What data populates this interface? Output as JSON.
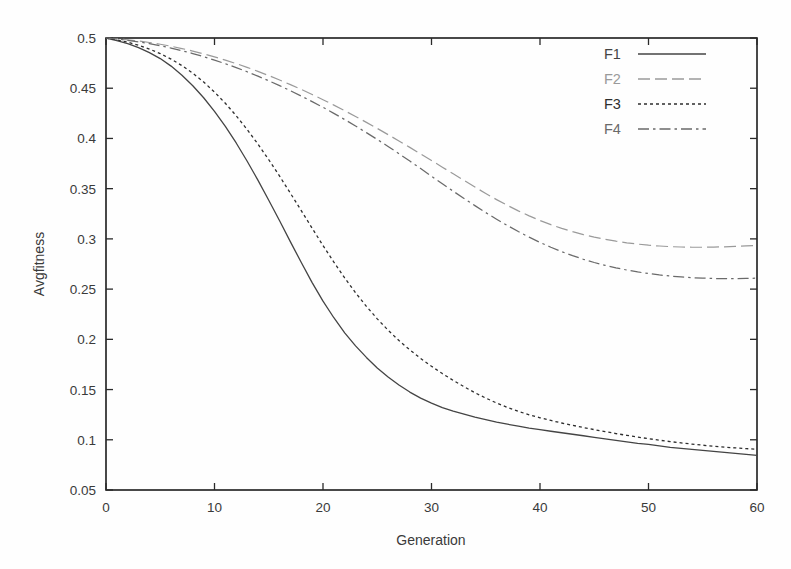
{
  "figure": {
    "background_color": "#fefefe",
    "frame_color": "#1c1c1c",
    "plot_left": 106,
    "plot_right": 757,
    "plot_top": 38,
    "plot_bottom": 490
  },
  "chart_data": {
    "type": "line",
    "title": "",
    "xlabel": "Generation",
    "ylabel": "Avgfitness",
    "xlim": [
      0,
      60
    ],
    "ylim": [
      0.05,
      0.5
    ],
    "xticks": [
      0,
      10,
      20,
      30,
      40,
      50,
      60
    ],
    "xtick_labels": [
      "0",
      "10",
      "20",
      "30",
      "40",
      "50",
      "60"
    ],
    "yticks": [
      0.05,
      0.1,
      0.15,
      0.2,
      0.25,
      0.3,
      0.35,
      0.4,
      0.45,
      0.5
    ],
    "ytick_labels": [
      "0.05",
      "0.1",
      "0.15",
      "0.2",
      "0.25",
      "0.3",
      "0.35",
      "0.4",
      "0.45",
      "0.5"
    ],
    "grid": false,
    "legend_position": "top-right",
    "x": [
      0,
      1,
      2,
      3,
      4,
      5,
      6,
      7,
      8,
      9,
      10,
      11,
      12,
      13,
      14,
      15,
      16,
      17,
      18,
      19,
      20,
      21,
      22,
      23,
      24,
      25,
      26,
      27,
      28,
      29,
      30,
      31,
      32,
      33,
      34,
      35,
      36,
      37,
      38,
      39,
      40,
      41,
      42,
      43,
      44,
      45,
      46,
      47,
      48,
      49,
      50,
      51,
      52,
      53,
      54,
      55,
      56,
      57,
      58,
      59,
      60
    ],
    "series": [
      {
        "name": "F1",
        "label": "F1",
        "style": "solid",
        "color": "#444444",
        "dash": "none",
        "width": 1.3,
        "values": [
          0.5,
          0.4975,
          0.4945,
          0.4905,
          0.4855,
          0.4795,
          0.472,
          0.463,
          0.4525,
          0.4405,
          0.427,
          0.412,
          0.3955,
          0.3775,
          0.3585,
          0.3385,
          0.318,
          0.297,
          0.2765,
          0.2565,
          0.238,
          0.2215,
          0.2065,
          0.1935,
          0.182,
          0.1715,
          0.1625,
          0.1545,
          0.1475,
          0.1415,
          0.1365,
          0.132,
          0.1285,
          0.1255,
          0.1225,
          0.12,
          0.1175,
          0.1155,
          0.1135,
          0.1115,
          0.11,
          0.1085,
          0.107,
          0.1055,
          0.104,
          0.1025,
          0.101,
          0.0995,
          0.098,
          0.0965,
          0.0955,
          0.094,
          0.0925,
          0.0915,
          0.0905,
          0.0895,
          0.0885,
          0.0875,
          0.0865,
          0.0855,
          0.0845
        ]
      },
      {
        "name": "F2",
        "label": "F2",
        "style": "long-dash",
        "color": "#9a9a9a",
        "dash": "12,5",
        "width": 1.2,
        "values": [
          0.5,
          0.4992,
          0.4982,
          0.497,
          0.4955,
          0.4938,
          0.4918,
          0.4895,
          0.487,
          0.4842,
          0.4812,
          0.478,
          0.4745,
          0.4708,
          0.4668,
          0.4626,
          0.4582,
          0.4536,
          0.4488,
          0.4438,
          0.4386,
          0.4332,
          0.4276,
          0.4219,
          0.416,
          0.41,
          0.4038,
          0.3975,
          0.3911,
          0.3846,
          0.378,
          0.3714,
          0.3648,
          0.3582,
          0.3516,
          0.3452,
          0.3391,
          0.3333,
          0.3279,
          0.3229,
          0.3183,
          0.3142,
          0.3105,
          0.3072,
          0.3043,
          0.3018,
          0.2996,
          0.2977,
          0.2961,
          0.2948,
          0.2937,
          0.2929,
          0.2923,
          0.2919,
          0.2917,
          0.2917,
          0.2918,
          0.2921,
          0.2925,
          0.293,
          0.2936
        ]
      },
      {
        "name": "F3",
        "label": "F3",
        "style": "dotted",
        "color": "#2e2e2e",
        "dash": "3,3",
        "width": 1.3,
        "values": [
          0.5,
          0.4982,
          0.4958,
          0.4928,
          0.489,
          0.4845,
          0.479,
          0.4725,
          0.465,
          0.4562,
          0.4462,
          0.435,
          0.4226,
          0.409,
          0.3944,
          0.3788,
          0.3624,
          0.3454,
          0.3281,
          0.3106,
          0.2934,
          0.2768,
          0.2611,
          0.2464,
          0.2328,
          0.2204,
          0.2091,
          0.1988,
          0.1895,
          0.181,
          0.1732,
          0.1659,
          0.1591,
          0.1528,
          0.1469,
          0.1415,
          0.1366,
          0.1322,
          0.1283,
          0.1249,
          0.1219,
          0.1192,
          0.1167,
          0.1144,
          0.1122,
          0.1101,
          0.1081,
          0.1062,
          0.1044,
          0.1027,
          0.1011,
          0.0996,
          0.0982,
          0.0969,
          0.0957,
          0.0946,
          0.0936,
          0.0927,
          0.0919,
          0.0912,
          0.0906
        ]
      },
      {
        "name": "F4",
        "label": "F4",
        "style": "dash-dot",
        "color": "#6a6a6a",
        "dash": "11,4,2.5,4",
        "width": 1.25,
        "values": [
          0.5,
          0.499,
          0.4977,
          0.4962,
          0.4944,
          0.4923,
          0.49,
          0.4874,
          0.4845,
          0.4814,
          0.478,
          0.4744,
          0.4705,
          0.4664,
          0.462,
          0.4574,
          0.4526,
          0.4475,
          0.4422,
          0.4367,
          0.431,
          0.425,
          0.4188,
          0.4124,
          0.4058,
          0.399,
          0.392,
          0.3848,
          0.3775,
          0.37,
          0.3624,
          0.3549,
          0.3475,
          0.3402,
          0.3331,
          0.3262,
          0.3196,
          0.3133,
          0.3073,
          0.3017,
          0.2965,
          0.2917,
          0.2873,
          0.2833,
          0.2797,
          0.2765,
          0.2737,
          0.2712,
          0.269,
          0.2671,
          0.2655,
          0.2641,
          0.263,
          0.2621,
          0.2614,
          0.2609,
          0.2606,
          0.2604,
          0.2604,
          0.2606,
          0.2609
        ]
      }
    ]
  },
  "legend": {
    "entries": [
      {
        "label": "F1"
      },
      {
        "label": "F2"
      },
      {
        "label": "F3"
      },
      {
        "label": "F4"
      }
    ]
  }
}
